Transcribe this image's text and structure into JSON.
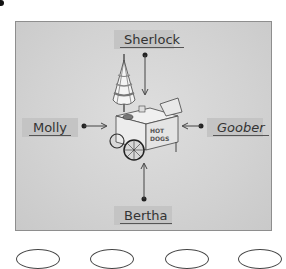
{
  "figure": {
    "center_object": "hot dog cart with umbrella",
    "cart_sign_text": "HOT DOGS",
    "labels": {
      "top": "Sherlock",
      "left": "Molly",
      "right": "Goober",
      "bottom": "Bertha"
    },
    "arrow_direction": "toward center"
  },
  "answer_choices": {
    "count": 4,
    "icon": "answer-bubble"
  },
  "colors": {
    "panel_background": "#d4d4d4",
    "label_background": "#c4c4c4",
    "text": "#333333"
  }
}
